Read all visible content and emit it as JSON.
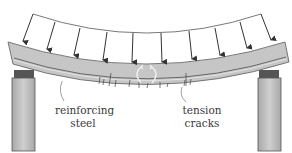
{
  "diagram": {
    "labels": {
      "steel_line1": "reinforcing",
      "steel_line2": "steel",
      "cracks_line1": "tension",
      "cracks_line2": "cracks"
    },
    "load_arrow_count": 10,
    "colors": {
      "beam_fill": "#c4c4c4",
      "beam_outline": "#6e6e6e",
      "support_fill": "#bdbdbd",
      "support_cap": "#555555",
      "arrow": "#333333",
      "label": "#3a3a3a"
    }
  }
}
